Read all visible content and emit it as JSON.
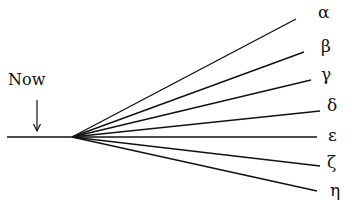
{
  "diagram": {
    "now_label": "Now",
    "origin": {
      "x": 72,
      "y": 137
    },
    "timeline": {
      "x1": 7,
      "y1": 137,
      "x2": 72,
      "y2": 137
    },
    "arrow": {
      "x": 37,
      "y1": 100,
      "y2": 131
    },
    "branches": [
      {
        "label": "α",
        "x2": 296,
        "y2": 19,
        "lx": 318,
        "ly": 4
      },
      {
        "label": "β",
        "x2": 304,
        "y2": 52,
        "lx": 321,
        "ly": 38
      },
      {
        "label": "γ",
        "x2": 311,
        "y2": 80,
        "lx": 321,
        "ly": 66
      },
      {
        "label": "δ",
        "x2": 320,
        "y2": 111,
        "lx": 327,
        "ly": 97
      },
      {
        "label": "ε",
        "x2": 317,
        "y2": 137,
        "lx": 328,
        "ly": 127
      },
      {
        "label": "ζ",
        "x2": 320,
        "y2": 166,
        "lx": 327,
        "ly": 154
      },
      {
        "label": "η",
        "x2": 317,
        "y2": 191,
        "lx": 330,
        "ly": 182
      }
    ],
    "stroke_color": "#111111"
  }
}
